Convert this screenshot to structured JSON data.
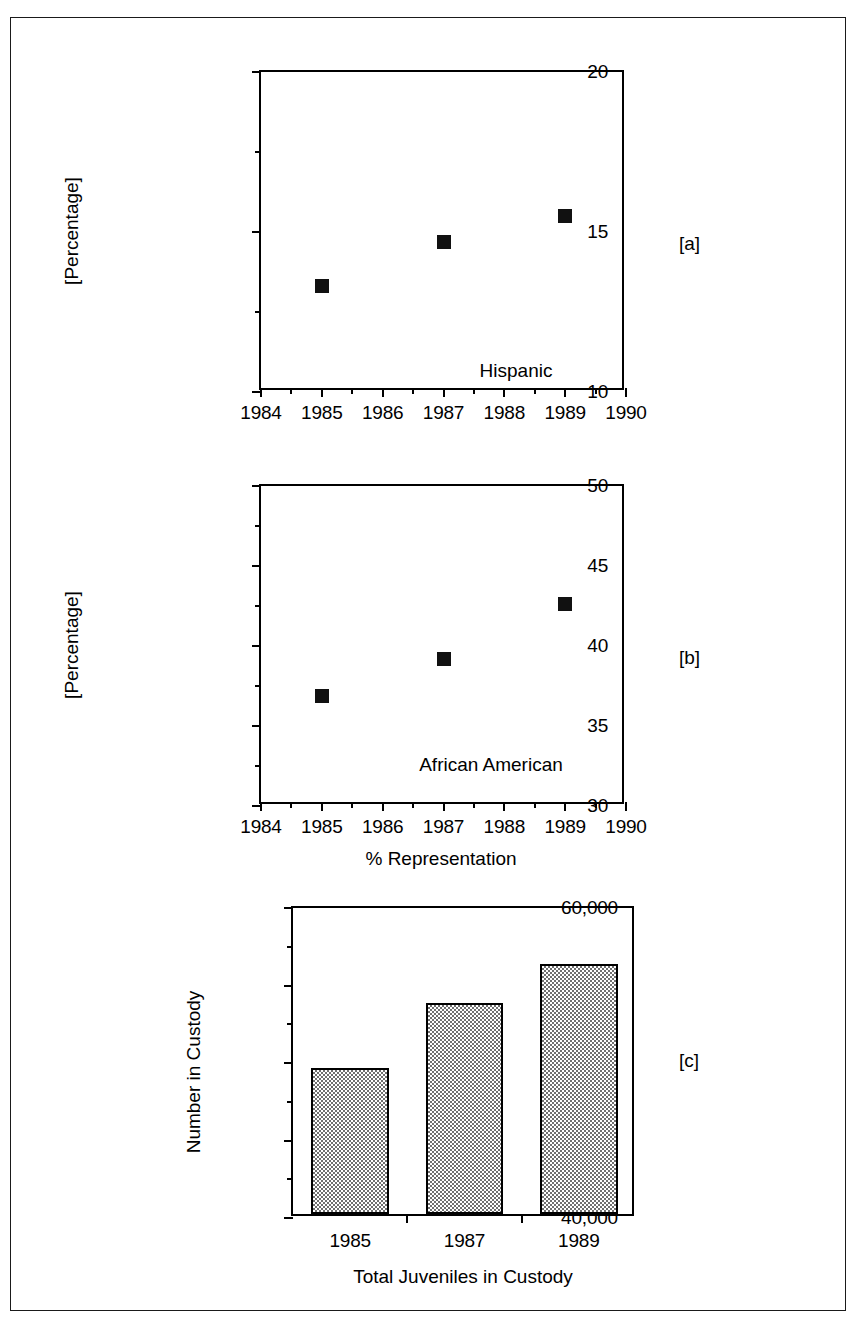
{
  "figure": {
    "panel_tags": [
      "[a]",
      "[b]",
      "[c]"
    ],
    "shared_x_axis_label": "% Representation"
  },
  "chart_data": [
    {
      "type": "scatter",
      "panel": "[a]",
      "title": "",
      "annotation": "Hispanic",
      "xlabel": "% Representation",
      "ylabel": "[Percentage]",
      "x": [
        1985,
        1987,
        1989
      ],
      "values": [
        13.3,
        14.7,
        15.5
      ],
      "xlim": [
        1984,
        1990
      ],
      "ylim": [
        10,
        20
      ],
      "xticks": [
        1984,
        1985,
        1986,
        1987,
        1988,
        1989,
        1990
      ],
      "xtick_labels": [
        "1984",
        "1985",
        "1986",
        "1987",
        "1988",
        "1989",
        "1990"
      ],
      "yticks": [
        10,
        15,
        20
      ],
      "ytick_labels": [
        "10",
        "15",
        "20"
      ],
      "y_minor_ticks": [
        12.5,
        17.5
      ],
      "x_minor_step": 0.5,
      "grid": false,
      "legend": false,
      "marker": "filled-square",
      "marker_color": "#111111"
    },
    {
      "type": "scatter",
      "panel": "[b]",
      "title": "",
      "annotation": "African American",
      "xlabel": "% Representation",
      "ylabel": "[Percentage]",
      "x": [
        1985,
        1987,
        1989
      ],
      "values": [
        36.9,
        39.2,
        42.6
      ],
      "xlim": [
        1984,
        1990
      ],
      "ylim": [
        30,
        50
      ],
      "xticks": [
        1984,
        1985,
        1986,
        1987,
        1988,
        1989,
        1990
      ],
      "xtick_labels": [
        "1984",
        "1985",
        "1986",
        "1987",
        "1988",
        "1989",
        "1990"
      ],
      "yticks": [
        30,
        35,
        40,
        45,
        50
      ],
      "ytick_labels": [
        "30",
        "35",
        "40",
        "45",
        "50"
      ],
      "y_minor_ticks": [
        32.5,
        37.5,
        42.5,
        47.5
      ],
      "x_minor_step": 0.5,
      "grid": false,
      "legend": false,
      "marker": "filled-square",
      "marker_color": "#111111"
    },
    {
      "type": "bar",
      "panel": "[c]",
      "title": "",
      "xlabel": "Total Juveniles in Custody",
      "ylabel": "Number in Custody",
      "categories": [
        "1985",
        "1987",
        "1989"
      ],
      "values": [
        49400,
        53600,
        56100
      ],
      "ylim": [
        40000,
        60000
      ],
      "yticks": [
        40000,
        45000,
        50000,
        55000,
        60000
      ],
      "ytick_labels": [
        "40,000",
        "45,000",
        "50,000",
        "55,000",
        "60,000"
      ],
      "y_minor_ticks": [
        42500,
        47500,
        52500,
        57500
      ],
      "grid": false,
      "legend": false,
      "bar_fill": "checkerboard-gray",
      "bar_edge_color": "#000000"
    }
  ]
}
